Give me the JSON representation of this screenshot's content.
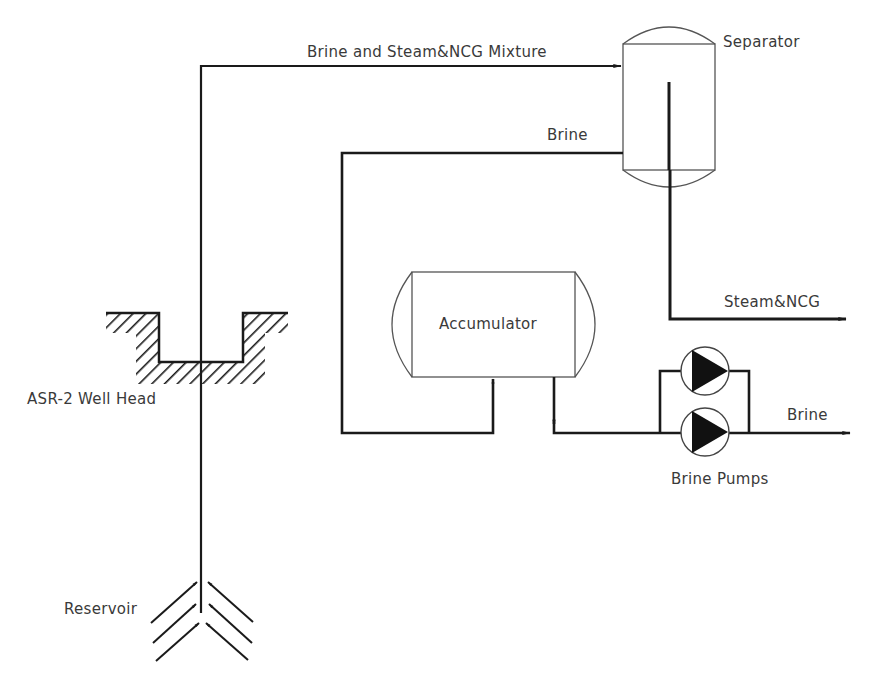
{
  "diagram": {
    "type": "process-flow",
    "labels": {
      "mixture_line": "Brine and Steam&NCG Mixture",
      "separator": "Separator",
      "brine_return": "Brine",
      "steam_out": "Steam&NCG",
      "accumulator": "Accumulator",
      "brine_out": "Brine",
      "pumps": "Brine Pumps",
      "well_head": "ASR-2 Well Head",
      "reservoir": "Reservoir"
    },
    "nodes": [
      {
        "id": "reservoir",
        "label": "Reservoir"
      },
      {
        "id": "well_head",
        "label": "ASR-2 Well Head"
      },
      {
        "id": "separator",
        "label": "Separator"
      },
      {
        "id": "accumulator",
        "label": "Accumulator"
      },
      {
        "id": "brine_pumps",
        "label": "Brine Pumps",
        "count": 2
      }
    ],
    "edges": [
      {
        "from": "reservoir",
        "to": "well_head"
      },
      {
        "from": "well_head",
        "to": "separator",
        "label": "Brine and Steam&NCG Mixture"
      },
      {
        "from": "separator",
        "to": "outlet_steam",
        "label": "Steam&NCG"
      },
      {
        "from": "separator",
        "to": "accumulator",
        "label": "Brine"
      },
      {
        "from": "accumulator",
        "to": "brine_pumps"
      },
      {
        "from": "brine_pumps",
        "to": "outlet_brine",
        "label": "Brine"
      }
    ],
    "colors": {
      "line": "#1a1a1a",
      "text": "#3a3a3a",
      "background": "#ffffff"
    }
  }
}
